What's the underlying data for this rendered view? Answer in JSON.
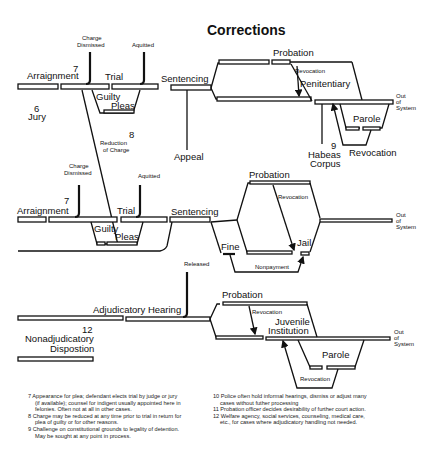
{
  "title": "Corrections",
  "felony_track": {
    "arraignment": "Arraignment",
    "note7": "7",
    "jury_num": "6",
    "jury": "Jury",
    "charge_dismissed": [
      "Charge",
      "Dismissed"
    ],
    "trial": "Trial",
    "acquitted": "Aquitted",
    "guilty": "Guilty",
    "pleas": "Pleas",
    "sentencing": "Sentencing",
    "appeal": "Appeal",
    "reduction_num": "8",
    "reduction": [
      "Reduction",
      "of Charge"
    ],
    "probation": "Probation",
    "revocation": "Revocation",
    "penitentiary": "Penitentiary",
    "parole": "Parole",
    "parole_revocation": "Revocation",
    "habeas_num": "9",
    "habeas": [
      "Habeas",
      "Corpus"
    ],
    "out_of_system": [
      "Out",
      "of",
      "System"
    ]
  },
  "misdemeanor_track": {
    "arraignment": "Arraignment",
    "note7": "7",
    "charge_dismissed": [
      "Charge",
      "Dismissed"
    ],
    "trial": "Trial",
    "acquitted": "Aquitted",
    "guilty": "Guilty",
    "pleas": "Pleas",
    "sentencing": "Sentencing",
    "probation": "Probation",
    "revocation": "Revocation",
    "fine": "Fine",
    "jail": "Jail",
    "nonpayment": "Nonpayment",
    "out_of_system": [
      "Out",
      "of",
      "System"
    ]
  },
  "juvenile_track": {
    "released": "Released",
    "adjudicatory_hearing": "Adjudicatory Hearing",
    "nonadj_num": "12",
    "nonadjudicatory": [
      "Nonadjudicatory",
      "Dispostion"
    ],
    "probation": "Probation",
    "revocation": "Revocation",
    "juvenile_institution": [
      "Juvenile",
      "Institution"
    ],
    "parole": "Parole",
    "parole_revocation": "Revocation",
    "out_of_system": [
      "Out",
      "of",
      "System"
    ]
  },
  "notes_left": [
    "7 Appearance for plea; defendant elects trial by judge or jury (if available); counsel for indigent usually appointed here in felonies. Often not at all in other cases.",
    "8 Charge may be reduced at any time prior to trial in return for plea of guilty or for other reasons.",
    "9 Challenge on constitutional grounds to legality of detention. May be sought at any point in process."
  ],
  "notes_right": [
    "10 Police often hold informal hearings, dismiss or adjust many cases without futher processing",
    "11 Probation officer decides desirability of further court action.",
    "12 Welfare agency, social services, counseling, medical care, etc., for cases where adjudicatory handling not needed."
  ]
}
